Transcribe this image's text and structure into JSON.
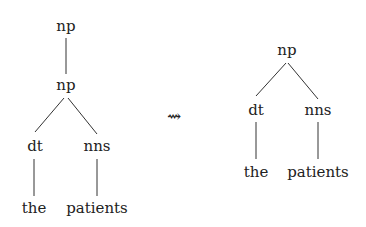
{
  "left_tree": {
    "root": "np",
    "child": "np",
    "left": "dt",
    "right": "nns",
    "left_leaf": "the",
    "right_leaf": "patients"
  },
  "transform_arrow": "⇝",
  "right_tree": {
    "root": "np",
    "left": "dt",
    "right": "nns",
    "left_leaf": "the",
    "right_leaf": "patients"
  }
}
